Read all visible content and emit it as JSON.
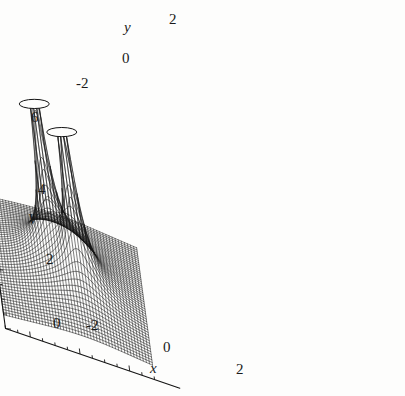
{
  "figure": {
    "kind": "3d-surface-mesh-plot",
    "background_color": "#fdfdfc",
    "line_color": "#141414",
    "title": "",
    "caption": ""
  },
  "axes": {
    "vertical": {
      "name": "V",
      "title": "V",
      "ticks": [
        "0",
        "2",
        "4",
        "6"
      ],
      "tick_values": [
        0,
        2,
        4,
        6
      ],
      "range": [
        0,
        6
      ],
      "minor_tick_step": 0.5
    },
    "depth": {
      "name": "y",
      "title": "y",
      "ticks": [
        "-2",
        "0",
        "2"
      ],
      "tick_values": [
        -2,
        0,
        2
      ],
      "range": [
        -3,
        3
      ],
      "minor_tick_step": 0.5
    },
    "horizontal": {
      "name": "x",
      "title": "x",
      "ticks": [
        "-2",
        "0",
        "2"
      ],
      "tick_values": [
        -2,
        0,
        2
      ],
      "range": [
        -3,
        3
      ],
      "minor_tick_step": 0.5
    }
  },
  "chart_data": {
    "type": "surface",
    "title": "",
    "xlabel": "x",
    "ylabel": "y",
    "zlabel": "V",
    "xlim": [
      -3,
      3
    ],
    "ylim": [
      -3,
      3
    ],
    "zlim": [
      0,
      6
    ],
    "grid": false,
    "legend": "none",
    "mesh": {
      "x_lines": 49,
      "y_lines": 49,
      "style": "wireframe-black-on-white"
    },
    "surface_function": "V(x,y) = 1/sqrt((x-x1)^2+(y-y1)^2) + 1/sqrt((x-x2)^2+(y-y2)^2), clipped to V <= 6",
    "singularities": [
      {
        "label": "peak-left",
        "x": -0.5,
        "y": 0.5,
        "clipped_at": 6
      },
      {
        "label": "peak-right",
        "x": 0.5,
        "y": -0.5,
        "clipped_at": 6
      }
    ],
    "z_values_note": "V tends to 0 at the plot edges and diverges at the two singular points; plotted surface is truncated at V = 6.",
    "sample_points": [
      {
        "x": -3,
        "y": -3,
        "V": 0.6
      },
      {
        "x": 0,
        "y": 0,
        "V": 2.8
      },
      {
        "x": 3,
        "y": 3,
        "V": 0.6
      },
      {
        "x": -0.5,
        "y": 0.5,
        "V": 6.0
      },
      {
        "x": 0.5,
        "y": -0.5,
        "V": 6.0
      }
    ]
  },
  "tick_labels": {
    "v": [
      {
        "text": "6",
        "x": 31,
        "y": 110
      },
      {
        "text": "4",
        "x": 38,
        "y": 182
      },
      {
        "text": "2",
        "x": 46,
        "y": 252
      },
      {
        "text": "0",
        "x": 53,
        "y": 316
      }
    ],
    "y": [
      {
        "text": "-2",
        "x": 76,
        "y": 76
      },
      {
        "text": "0",
        "x": 122,
        "y": 51
      },
      {
        "text": "2",
        "x": 169,
        "y": 12
      }
    ],
    "x": [
      {
        "text": "-2",
        "x": 86,
        "y": 318
      },
      {
        "text": "0",
        "x": 163,
        "y": 340
      },
      {
        "text": "2",
        "x": 236,
        "y": 362
      }
    ]
  },
  "axis_titles": {
    "v": {
      "text": "V",
      "x": 28,
      "y": 212
    },
    "y": {
      "text": "y",
      "x": 124,
      "y": 20
    },
    "x": {
      "text": "x",
      "x": 150,
      "y": 361
    }
  }
}
